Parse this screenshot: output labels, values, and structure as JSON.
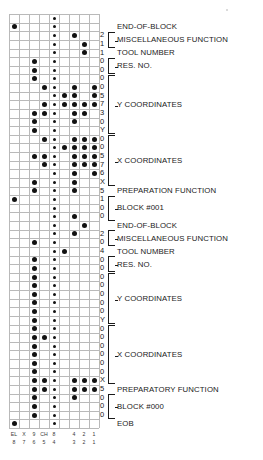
{
  "diagram": {
    "tape": {
      "columns": 9,
      "rows": 46,
      "sprocket_column_index": 4,
      "channel_top_labels": [
        "EL",
        "X",
        "9",
        "CH",
        "8",
        "",
        "4",
        "2",
        "1"
      ],
      "channel_bottom_labels": [
        "8",
        "7",
        "6",
        "5",
        "4",
        "",
        "3",
        "2",
        "1"
      ],
      "hole_color": "#111111",
      "grid_color": "#b9b9b9"
    },
    "rows": [
      {
        "index": 0,
        "char": "",
        "holes": [
          4
        ]
      },
      {
        "index": 1,
        "char": "",
        "holes": [
          0,
          4
        ]
      },
      {
        "index": 2,
        "char": "2",
        "holes": [
          4,
          6
        ]
      },
      {
        "index": 3,
        "char": "1",
        "holes": [
          4,
          7
        ]
      },
      {
        "index": 4,
        "char": "1",
        "holes": [
          4,
          7
        ]
      },
      {
        "index": 5,
        "char": "0",
        "holes": [
          2,
          4
        ]
      },
      {
        "index": 6,
        "char": "0",
        "holes": [
          2,
          4
        ]
      },
      {
        "index": 7,
        "char": "0",
        "holes": [
          2,
          4
        ]
      },
      {
        "index": 8,
        "char": "0",
        "holes": [
          3,
          4,
          6,
          8
        ]
      },
      {
        "index": 9,
        "char": "5",
        "holes": [
          4,
          5,
          6,
          8
        ]
      },
      {
        "index": 10,
        "char": "7",
        "holes": [
          3,
          4,
          5,
          6,
          7,
          8
        ]
      },
      {
        "index": 11,
        "char": "3",
        "holes": [
          2,
          3,
          4,
          6,
          7
        ]
      },
      {
        "index": 12,
        "char": "0",
        "holes": [
          2,
          4,
          6
        ]
      },
      {
        "index": 13,
        "char": "Y",
        "holes": [
          2,
          4
        ]
      },
      {
        "index": 14,
        "char": "0",
        "holes": [
          3,
          4,
          6,
          7,
          8
        ]
      },
      {
        "index": 15,
        "char": "0",
        "holes": [
          4,
          5,
          6,
          7,
          8
        ]
      },
      {
        "index": 16,
        "char": "5",
        "holes": [
          2,
          3,
          4,
          6,
          7,
          8
        ]
      },
      {
        "index": 17,
        "char": "7",
        "holes": [
          3,
          4,
          6,
          7,
          8
        ]
      },
      {
        "index": 18,
        "char": "6",
        "holes": [
          4,
          6,
          8
        ]
      },
      {
        "index": 19,
        "char": "X",
        "holes": [
          2,
          4,
          6
        ]
      },
      {
        "index": 20,
        "char": "5",
        "holes": [
          2,
          4,
          6
        ]
      },
      {
        "index": 21,
        "char": "1",
        "holes": [
          0,
          4
        ]
      },
      {
        "index": 22,
        "char": "0",
        "holes": [
          4
        ]
      },
      {
        "index": 23,
        "char": "0",
        "holes": [
          4,
          6
        ]
      },
      {
        "index": 24,
        "char": "",
        "holes": [
          4,
          7
        ]
      },
      {
        "index": 25,
        "char": "2",
        "holes": [
          4,
          6
        ]
      },
      {
        "index": 26,
        "char": "0",
        "holes": [
          2,
          4
        ]
      },
      {
        "index": 27,
        "char": "4",
        "holes": [
          4,
          5
        ]
      },
      {
        "index": 28,
        "char": "0",
        "holes": [
          2,
          4
        ]
      },
      {
        "index": 29,
        "char": "0",
        "holes": [
          2,
          4
        ]
      },
      {
        "index": 30,
        "char": "0",
        "holes": [
          2,
          4
        ]
      },
      {
        "index": 31,
        "char": "0",
        "holes": [
          2,
          4
        ]
      },
      {
        "index": 32,
        "char": "0",
        "holes": [
          2,
          4
        ]
      },
      {
        "index": 33,
        "char": "0",
        "holes": [
          2,
          4
        ]
      },
      {
        "index": 34,
        "char": "0",
        "holes": [
          2,
          4
        ]
      },
      {
        "index": 35,
        "char": "Y",
        "holes": [
          2,
          4
        ]
      },
      {
        "index": 36,
        "char": "0",
        "holes": [
          2,
          4
        ]
      },
      {
        "index": 37,
        "char": "0",
        "holes": [
          2,
          3,
          4
        ]
      },
      {
        "index": 38,
        "char": "0",
        "holes": [
          2,
          4
        ]
      },
      {
        "index": 39,
        "char": "0",
        "holes": [
          2,
          4
        ]
      },
      {
        "index": 40,
        "char": "0",
        "holes": [
          2,
          4
        ]
      },
      {
        "index": 41,
        "char": "0",
        "holes": [
          2,
          4
        ]
      },
      {
        "index": 42,
        "char": "X",
        "holes": [
          2,
          3,
          4,
          6,
          7,
          8
        ]
      },
      {
        "index": 43,
        "char": "5",
        "holes": [
          2,
          3,
          4,
          6,
          7,
          8
        ]
      },
      {
        "index": 44,
        "char": "0",
        "holes": [
          2,
          4,
          6
        ]
      },
      {
        "index": 45,
        "char": "0",
        "holes": [
          2,
          4
        ]
      },
      {
        "index": 46,
        "char": "0",
        "holes": [
          2,
          4
        ]
      },
      {
        "index": 47,
        "char": "",
        "holes": [
          0,
          4
        ]
      }
    ],
    "annotations": [
      {
        "id": "a1",
        "text": "END-OF-BLOCK",
        "brace": false
      },
      {
        "id": "a2",
        "text": "MISCELLANEOUS FUNCTION",
        "brace": true
      },
      {
        "id": "a3",
        "text": "TOOL NUMBER",
        "brace": false
      },
      {
        "id": "a4",
        "text": "RES. NO.",
        "brace": true
      },
      {
        "id": "a5",
        "text": "Y COORDINATES",
        "brace": true
      },
      {
        "id": "a6",
        "text": "X COORDINATES",
        "brace": true
      },
      {
        "id": "a7",
        "text": "PREPARATION FUNCTION",
        "brace": false
      },
      {
        "id": "a8",
        "text": "BLOCK #001",
        "brace": true
      },
      {
        "id": "a9",
        "text": "END-OF-BLOCK",
        "brace": false
      },
      {
        "id": "a10",
        "text": "MISCELLANEOUS FUNCTION",
        "brace": true
      },
      {
        "id": "a11",
        "text": "TOOL NUMBER",
        "brace": false
      },
      {
        "id": "a12",
        "text": "RES. NO.",
        "brace": true
      },
      {
        "id": "a13",
        "text": "Y COORDINATES",
        "brace": true
      },
      {
        "id": "a14",
        "text": "X COORDINATES",
        "brace": true
      },
      {
        "id": "a15",
        "text": "PREPARATORY FUNCTION",
        "brace": false
      },
      {
        "id": "a16",
        "text": "BLOCK #000",
        "brace": true
      },
      {
        "id": "a17",
        "text": "EOB",
        "brace": false
      }
    ]
  }
}
